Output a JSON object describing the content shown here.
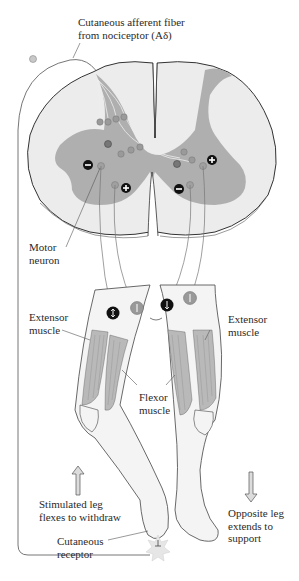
{
  "labels": {
    "afferent_line1": "Cutaneous afferent fiber",
    "afferent_line2": "from nociceptor (Aδ)",
    "motor_line1": "Motor",
    "motor_line2": "neuron",
    "extensor_left_line1": "Extensor",
    "extensor_left_line2": "muscle",
    "extensor_right_line1": "Extensor",
    "extensor_right_line2": "muscle",
    "flexor_line1": "Flexor",
    "flexor_line2": "muscle",
    "stimulated_line1": "Stimulated leg",
    "stimulated_line2": "flexes to withdraw",
    "opposite_line1": "Opposite leg",
    "opposite_line2": "extends to",
    "opposite_line3": "support",
    "receptor_line1": "Cutaneous",
    "receptor_line2": "receptor"
  },
  "symbols": {
    "inhibitory": "−",
    "excitatory": "+"
  },
  "colors": {
    "gray_matter": "#a9a9a9",
    "white_matter": "#ececec",
    "outline": "#444444",
    "neuron": "#9a9a9a",
    "inhibitory_neuron": "#777777",
    "muscle": "#b9b9b9",
    "skin": "#f4f4f4",
    "badge_dark": "#111111",
    "badge_light": "#999999",
    "arrow_fill": "#dcdcdc",
    "stimulus": "#e2e2e2"
  }
}
